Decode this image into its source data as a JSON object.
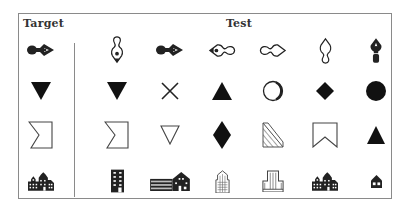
{
  "labels": {
    "target": "Target",
    "test": "Test"
  },
  "columns": {
    "target_x": 41,
    "test_x": [
      117,
      170,
      222,
      273,
      325,
      376
    ]
  },
  "rows_y": [
    50,
    91,
    135,
    181
  ],
  "rows": [
    {
      "target": "pen-nib-pointing-right-icon",
      "test": [
        "pen-nib-outline-pointing-down-icon",
        "pen-nib-pointing-right-icon",
        "pen-nib-outline-pointing-left-icon",
        "pen-nib-outline-pointing-right-icon",
        "pen-nib-outline-pointing-up-icon",
        "pen-nib-filled-pointing-up-icon"
      ]
    },
    {
      "target": "filled-down-triangle-icon",
      "test": [
        "filled-down-triangle-icon",
        "x-cross-icon",
        "filled-up-triangle-icon",
        "outline-circle-icon",
        "filled-diamond-icon",
        "filled-circle-icon"
      ]
    },
    {
      "target": "outline-flag-notch-left-icon",
      "test": [
        "outline-flag-notch-left-icon",
        "outline-down-triangle-icon",
        "filled-tall-diamond-icon",
        "hatched-right-triangle-icon",
        "outline-banner-notch-bottom-icon",
        "filled-up-triangle-small-icon"
      ]
    },
    {
      "target": "townhouses-building-icon",
      "test": [
        "tall-office-building-icon",
        "long-school-building-icon",
        "skyscraper-outline-icon",
        "office-block-outline-icon",
        "townhouses-building-icon",
        "small-house-icon"
      ]
    }
  ]
}
